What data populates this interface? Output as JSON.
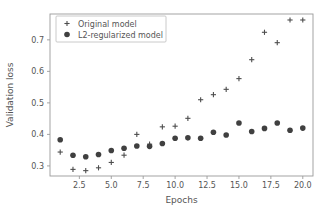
{
  "chart_data": {
    "type": "scatter",
    "title": "",
    "xlabel": "Epochs",
    "ylabel": "Validation loss",
    "xlim": [
      0.2,
      20.8
    ],
    "ylim": [
      0.268,
      0.782
    ],
    "xticks": [
      2.5,
      5.0,
      7.5,
      10.0,
      12.5,
      15.0,
      17.5,
      20.0
    ],
    "xticklabels": [
      "2.5",
      "5.0",
      "7.5",
      "10.0",
      "12.5",
      "15.0",
      "17.5",
      "20.0"
    ],
    "yticks": [
      0.3,
      0.4,
      0.5,
      0.6,
      0.7
    ],
    "yticklabels": [
      "0.3",
      "0.4",
      "0.5",
      "0.6",
      "0.7"
    ],
    "grid": false,
    "legend_position": "upper left",
    "x": [
      1,
      2,
      3,
      4,
      5,
      6,
      7,
      8,
      9,
      10,
      11,
      12,
      13,
      14,
      15,
      16,
      17,
      18,
      19,
      20
    ],
    "series": [
      {
        "name": "Original model",
        "marker": "plus",
        "color": "#4d4d4d",
        "values": [
          0.344,
          0.289,
          0.285,
          0.294,
          0.311,
          0.334,
          0.4,
          0.369,
          0.424,
          0.426,
          0.451,
          0.51,
          0.526,
          0.543,
          0.577,
          0.637,
          0.724,
          0.691,
          0.763,
          0.763
        ]
      },
      {
        "name": "L2-regularized model",
        "marker": "circle",
        "color": "#404040",
        "values": [
          0.383,
          0.334,
          0.329,
          0.336,
          0.349,
          0.356,
          0.363,
          0.362,
          0.371,
          0.388,
          0.389,
          0.388,
          0.407,
          0.398,
          0.436,
          0.409,
          0.419,
          0.436,
          0.413,
          0.42
        ]
      }
    ]
  },
  "legend": {
    "entries": [
      {
        "label": "Original model",
        "marker": "plus-icon"
      },
      {
        "label": "L2-regularized model",
        "marker": "circle-icon"
      }
    ]
  },
  "axes": {
    "xlabel": "Epochs",
    "ylabel": "Validation loss"
  }
}
